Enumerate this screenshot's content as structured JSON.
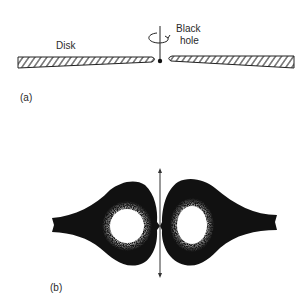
{
  "panel_a": {
    "label": "(a)",
    "disk_label": "Disk",
    "black_hole_label_line1": "Black",
    "black_hole_label_line2": "hole"
  },
  "panel_b": {
    "label": "(b)"
  },
  "colors": {
    "ink": "#111111",
    "background": "#ffffff"
  }
}
